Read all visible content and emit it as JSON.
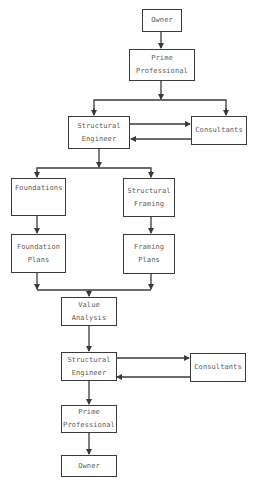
{
  "diagram": {
    "type": "flowchart",
    "colors": {
      "line": "#3a3a3a",
      "text": "#5a5a5a",
      "background": "#ffffff"
    },
    "nodes": {
      "owner_top": {
        "line1": "Owner"
      },
      "prime_top": {
        "line1": "Prime",
        "line2": "Professional"
      },
      "se_top": {
        "line1": "Structural",
        "line2": "Engineer"
      },
      "consultants_top": {
        "line1": "Consultants"
      },
      "foundations": {
        "line1": "Foundations"
      },
      "structural_framing": {
        "line1": "Structural",
        "line2": "Framing"
      },
      "foundation_plans": {
        "line1": "Foundation",
        "line2": "Plans"
      },
      "framing_plans": {
        "line1": "Framing",
        "line2": "Plans"
      },
      "value_analysis": {
        "line1": "Value",
        "line2": "Analysis"
      },
      "se_bottom": {
        "line1": "Structural",
        "line2": "Engineer"
      },
      "consultants_bottom": {
        "line1": "Consultants"
      },
      "prime_bottom": {
        "line1": "Prime",
        "line2": "Professional"
      },
      "owner_bottom": {
        "line1": "Owner"
      }
    },
    "edges": [
      {
        "from": "Owner",
        "to": "Prime Professional"
      },
      {
        "from": "Prime Professional",
        "to": "Structural Engineer"
      },
      {
        "from": "Prime Professional",
        "to": "Consultants"
      },
      {
        "from": "Structural Engineer",
        "to": "Consultants"
      },
      {
        "from": "Consultants",
        "to": "Structural Engineer"
      },
      {
        "from": "Structural Engineer",
        "to": "Foundations"
      },
      {
        "from": "Structural Engineer",
        "to": "Structural Framing"
      },
      {
        "from": "Foundations",
        "to": "Foundation Plans"
      },
      {
        "from": "Structural Framing",
        "to": "Framing Plans"
      },
      {
        "from": "Foundation Plans",
        "to": "Value Analysis"
      },
      {
        "from": "Framing Plans",
        "to": "Value Analysis"
      },
      {
        "from": "Value Analysis",
        "to": "Structural Engineer"
      },
      {
        "from": "Structural Engineer",
        "to": "Consultants"
      },
      {
        "from": "Consultants",
        "to": "Structural Engineer"
      },
      {
        "from": "Structural Engineer",
        "to": "Prime Professional"
      },
      {
        "from": "Prime Professional",
        "to": "Owner"
      }
    ]
  }
}
